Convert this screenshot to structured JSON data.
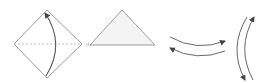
{
  "diagram": {
    "title": "",
    "background": "#ffffff",
    "stroke_color": "#9a9a9a",
    "arrow_color": "#555555",
    "fill_color": "#f4f4f4",
    "figures": [
      {
        "id": "diamond",
        "shape": "square-rotated-45",
        "points": [
          [
            47,
            10
          ],
          [
            82,
            44
          ],
          [
            47,
            78
          ],
          [
            14,
            44
          ]
        ],
        "fold_line": {
          "style": "dashed",
          "from": [
            14,
            44
          ],
          "to": [
            82,
            44
          ]
        },
        "arrow": {
          "direction": "bottom-to-top",
          "curve": "bow-right",
          "path": "M46 76 Q66 44 45 13"
        },
        "label": "d"
      },
      {
        "id": "triangle",
        "shape": "triangle",
        "points": [
          [
            122,
            10
          ],
          [
            155,
            45
          ],
          [
            90,
            45
          ]
        ]
      },
      {
        "id": "horizontal-arrows",
        "arrows": [
          {
            "path": "M170 37 Q197 52 225 41",
            "head": "end"
          },
          {
            "path": "M170 48 Q197 62 225 51",
            "head": "start"
          }
        ]
      },
      {
        "id": "vertical-arrows",
        "arrows": [
          {
            "path": "M247 17 Q228 48 245 80",
            "head": "end"
          },
          {
            "path": "M253 80 Q236 48 254 17",
            "head": "end"
          }
        ]
      }
    ]
  }
}
